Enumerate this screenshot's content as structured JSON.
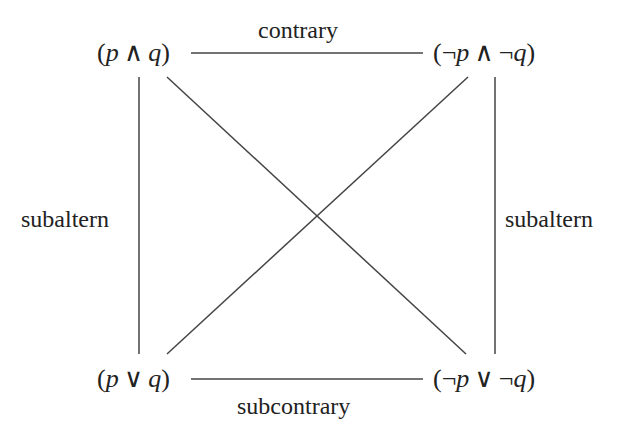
{
  "diagram": {
    "nodes": {
      "top_left": {
        "open": "(",
        "a": "p",
        "op": "∧",
        "b": "q",
        "close": ")",
        "neg_a": "",
        "neg_b": ""
      },
      "top_right": {
        "open": "(",
        "a": "p",
        "op": "∧",
        "b": "q",
        "close": ")",
        "neg_a": "¬",
        "neg_b": "¬"
      },
      "bottom_left": {
        "open": "(",
        "a": "p",
        "op": "∨",
        "b": "q",
        "close": ")",
        "neg_a": "",
        "neg_b": ""
      },
      "bottom_right": {
        "open": "(",
        "a": "p",
        "op": "∨",
        "b": "q",
        "close": ")",
        "neg_a": "¬",
        "neg_b": "¬"
      }
    },
    "relations": {
      "top": "contrary",
      "bottom": "subcontrary",
      "left": "subaltern",
      "right": "subaltern"
    },
    "colors": {
      "line": "#444444",
      "text": "#222222",
      "background": "#ffffff"
    }
  }
}
